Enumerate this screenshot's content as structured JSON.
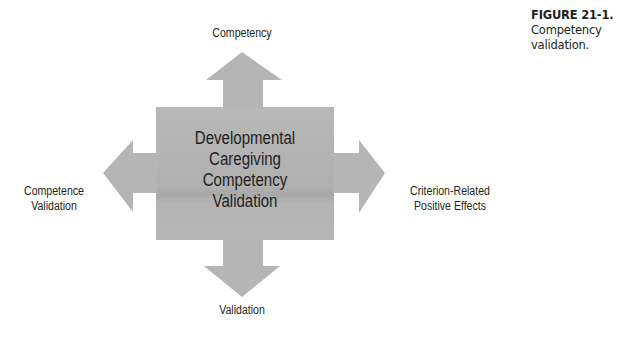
{
  "diagram": {
    "center_label": [
      "Developmental",
      "Caregiving",
      "Competency",
      "Validation"
    ],
    "arrows": {
      "top": "Competency",
      "left": [
        "Competence",
        "Validation"
      ],
      "right": [
        "Criterion-Related",
        "Positive Effects"
      ],
      "bottom": "Validation"
    },
    "colors": {
      "shape_fill": "#b3b3b3",
      "text": "#231f20"
    }
  },
  "caption": {
    "label": "FIGURE 21-1.",
    "text_line1": "Competency",
    "text_line2": "validation."
  }
}
